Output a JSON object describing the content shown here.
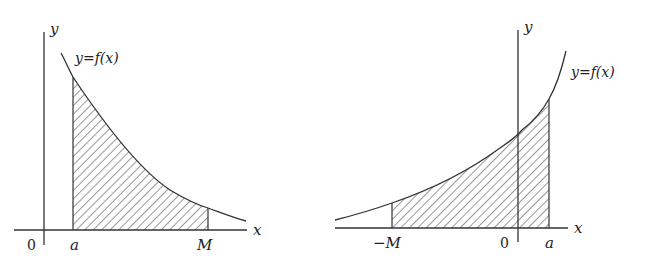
{
  "figure": {
    "left_panel": {
      "axis_y_label": "y",
      "axis_x_label": "x",
      "origin_label": "0",
      "curve_label": "y=f(x)",
      "lower_bound_label": "a",
      "upper_bound_label": "M",
      "description": "Decreasing curve y=f(x); shaded region between x=a and x=M under the curve"
    },
    "right_panel": {
      "axis_y_label": "y",
      "axis_x_label": "x",
      "origin_label": "0",
      "curve_label": "y=f(x)",
      "lower_bound_label": "−M",
      "upper_bound_label": "a",
      "description": "Increasing curve y=f(x); shaded region between x=−M and x=a under the curve"
    },
    "colors": {
      "line": "#333333",
      "hatch": "#444444",
      "background": "#ffffff"
    }
  }
}
